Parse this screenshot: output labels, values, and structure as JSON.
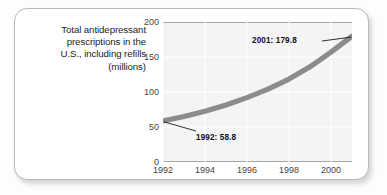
{
  "figure": {
    "caption_lines": [
      "Total antidepressant",
      "prescriptions in the",
      "U.S., including refills",
      "(millions)"
    ],
    "frame_border_color": "#b9b9b9",
    "plot_background_color": "#f4f4f4",
    "gridline_color": "#ffffff",
    "line_color": "#8c8c8c",
    "text_color": "#1d1d1d"
  },
  "chart_data": {
    "type": "line",
    "title": "Total antidepressant prescriptions in the U.S., including refills (millions)",
    "xlabel": "",
    "ylabel": "",
    "xlim": [
      1992,
      2001
    ],
    "ylim": [
      0,
      200
    ],
    "grid": true,
    "legend": "none",
    "x": [
      1992,
      1993,
      1994,
      1995,
      1996,
      1997,
      1998,
      1999,
      2000,
      2001
    ],
    "values": [
      58.8,
      65.0,
      72.5,
      81.5,
      92.0,
      104.0,
      118.5,
      136.0,
      157.0,
      179.8
    ],
    "series": [
      {
        "name": "Total antidepressant prescriptions (millions)",
        "values": [
          58.8,
          65.0,
          72.5,
          81.5,
          92.0,
          104.0,
          118.5,
          136.0,
          157.0,
          179.8
        ]
      }
    ],
    "xticks": [
      "1992",
      "1994",
      "1996",
      "1998",
      "2000"
    ],
    "xtick_values": [
      1992,
      1994,
      1996,
      1998,
      2000
    ],
    "yticks": [
      "0",
      "50",
      "100",
      "150",
      "200"
    ],
    "ytick_values": [
      0,
      50,
      100,
      150,
      200
    ],
    "annotations": [
      {
        "label": "1992: 58.8",
        "x": 1992,
        "y": 58.8
      },
      {
        "label": "2001: 179.8",
        "x": 2001,
        "y": 179.8
      }
    ]
  }
}
